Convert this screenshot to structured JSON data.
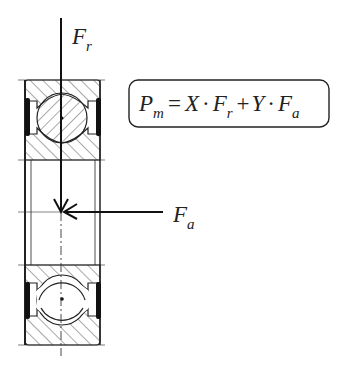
{
  "diagram": {
    "labels": {
      "radial_force": "F",
      "radial_force_sub": "r",
      "axial_force": "F",
      "axial_force_sub": "a"
    },
    "formula": {
      "lhs": "P",
      "lhs_sub": "m",
      "eq": "=",
      "t1_coef": "X",
      "dot": "·",
      "t1_var": "F",
      "t1_sub": "r",
      "plus": "+",
      "t2_coef": "Y",
      "t2_var": "F",
      "t2_sub": "a"
    },
    "colors": {
      "line": "#222222",
      "hatch": "#555555",
      "background": "#ffffff"
    }
  }
}
